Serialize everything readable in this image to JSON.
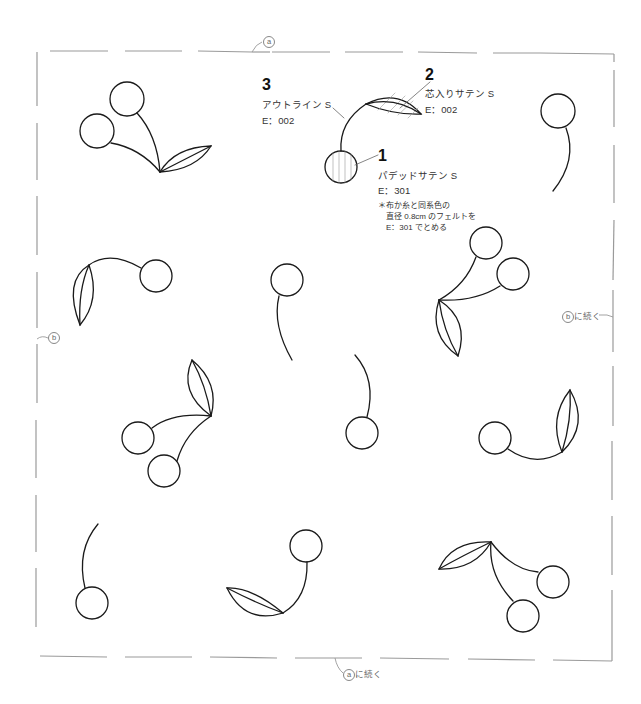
{
  "diagram": {
    "type": "embroidery-pattern",
    "motif": "cherry",
    "stroke_color": "#1a1a1a",
    "border_color": "#999999"
  },
  "legend": {
    "item3": {
      "number": "3",
      "stitch": "アウトライン S",
      "thread": "E：002"
    },
    "item2": {
      "number": "2",
      "stitch": "芯入りサテン S",
      "thread": "E：002"
    },
    "item1": {
      "number": "1",
      "stitch": "パデッドサテン S",
      "thread": "E：301",
      "note": "＊布か糸と同系色の\n　直径 0.8cm のフェルトを\n　E：301 でとめる"
    }
  },
  "markers": {
    "top": {
      "letter": "a",
      "text": ""
    },
    "left": {
      "letter": "b",
      "text": ""
    },
    "right": {
      "letter": "b",
      "text": "に続く"
    },
    "bottom": {
      "letter": "a",
      "text": "に続く"
    }
  }
}
